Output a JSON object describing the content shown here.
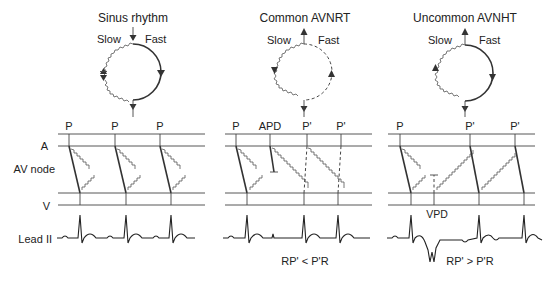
{
  "panels": [
    {
      "title": "Sinus rhythm",
      "circuit": {
        "slow_label": "Slow",
        "fast_label": "Fast"
      },
      "beat_labels": [
        "P",
        "P",
        "P"
      ]
    },
    {
      "title": "Common AVNRT",
      "circuit": {
        "slow_label": "Slow",
        "fast_label": "Fast"
      },
      "beat_labels": [
        "P",
        "APD",
        "P'",
        "P'"
      ],
      "caption": "RP' < P'R"
    },
    {
      "title": "Uncommon AVNHT",
      "circuit": {
        "slow_label": "Slow",
        "fast_label": "Fast"
      },
      "beat_labels": [
        "P",
        "P'",
        "P'"
      ],
      "annotation": "VPD",
      "caption": "RP' > P'R"
    }
  ],
  "row_labels": {
    "atrium": "A",
    "av_node": "AV node",
    "ventricle": "V",
    "ecg": "Lead II"
  },
  "colors": {
    "line": "#333333",
    "background": "#ffffff"
  }
}
